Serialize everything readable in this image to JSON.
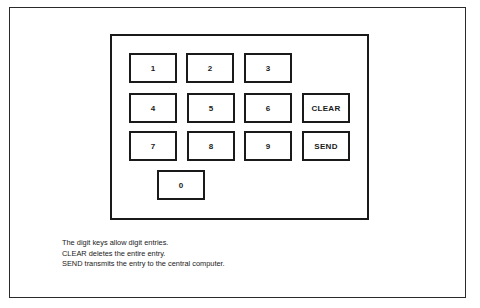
{
  "keypad": {
    "keys": [
      {
        "label": "1",
        "x": 129,
        "y": 53
      },
      {
        "label": "2",
        "x": 186,
        "y": 53
      },
      {
        "label": "3",
        "x": 244,
        "y": 53
      },
      {
        "label": "4",
        "x": 129,
        "y": 93
      },
      {
        "label": "5",
        "x": 187,
        "y": 93
      },
      {
        "label": "6",
        "x": 244,
        "y": 93
      },
      {
        "label": "CLEAR",
        "x": 302,
        "y": 93
      },
      {
        "label": "7",
        "x": 129,
        "y": 131
      },
      {
        "label": "8",
        "x": 187,
        "y": 131
      },
      {
        "label": "9",
        "x": 244,
        "y": 131
      },
      {
        "label": "SEND",
        "x": 302,
        "y": 131
      },
      {
        "label": "0",
        "x": 157,
        "y": 170
      }
    ]
  },
  "caption": {
    "lines": [
      "The digit keys allow digit entries.",
      "CLEAR deletes the entire entry.",
      "SEND transmits the entry to the central computer."
    ]
  }
}
